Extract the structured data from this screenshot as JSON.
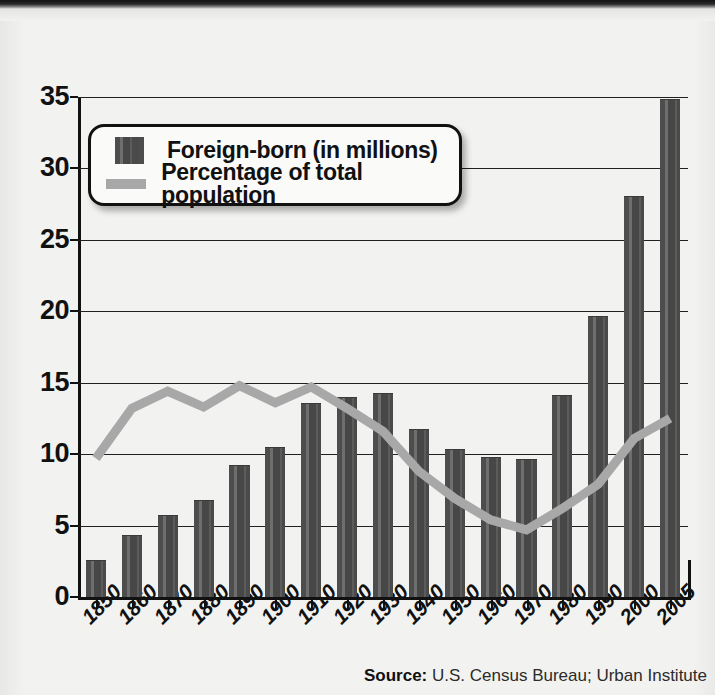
{
  "chart_data": {
    "type": "bar",
    "title": "",
    "xlabel": "",
    "ylabel": "",
    "ylim": [
      0,
      35
    ],
    "ytick_step": 5,
    "yticks": [
      0,
      5,
      10,
      15,
      20,
      25,
      30,
      35
    ],
    "grid": true,
    "legend_position": "top-left",
    "categories": [
      "1850",
      "1860",
      "1870",
      "1880",
      "1890",
      "1900",
      "1910",
      "1920",
      "1930",
      "1940",
      "1950",
      "1960",
      "1970",
      "1980",
      "1990",
      "2000",
      "2005"
    ],
    "series": [
      {
        "name": "Foreign-born (in millions)",
        "type": "bar",
        "color": "#4a4a4a",
        "values": [
          2.5,
          4.3,
          5.7,
          6.7,
          9.2,
          10.4,
          13.5,
          13.9,
          14.2,
          11.7,
          10.3,
          9.7,
          9.6,
          14.1,
          19.6,
          28.0,
          34.8
        ]
      },
      {
        "name": "Percentage of total population",
        "type": "line",
        "color": "#a8a8a8",
        "values": [
          9.7,
          13.2,
          14.4,
          13.3,
          14.8,
          13.6,
          14.7,
          13.2,
          11.6,
          8.8,
          6.9,
          5.4,
          4.7,
          6.2,
          7.9,
          11.1,
          12.5
        ]
      }
    ],
    "source_label": "Source:",
    "source_text": "U.S. Census Bureau; Urban Institute"
  },
  "legend": {
    "items": [
      {
        "label": "Foreign-born (in millions)",
        "swatch": "bar-swatch"
      },
      {
        "label": "Percentage of total population",
        "swatch": "line-swatch"
      }
    ]
  },
  "source": {
    "label": "Source:",
    "text": "U.S. Census Bureau; Urban Institute"
  },
  "colors": {
    "bar": "#4a4a4a",
    "line": "#a8a8a8",
    "axis": "#111111",
    "background": "#f2f2f0"
  }
}
